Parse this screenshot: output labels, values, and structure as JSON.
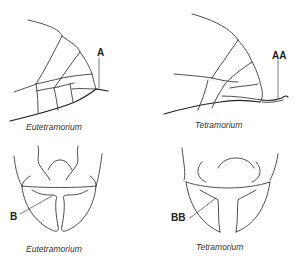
{
  "panels": [
    {
      "position": "top-left",
      "view": "gaster lateral",
      "caption": "Eutetramorium",
      "marker": "A"
    },
    {
      "position": "top-right",
      "view": "gaster lateral",
      "caption": "Tetramorium",
      "marker": "AA"
    },
    {
      "position": "bottom-left",
      "view": "head/mandibles",
      "caption": "Eutetramorium",
      "marker": "B"
    },
    {
      "position": "bottom-right",
      "view": "head/mandibles",
      "caption": "Tetramorium",
      "marker": "BB"
    }
  ],
  "colors": {
    "line": "#222222",
    "background": "#ffffff"
  }
}
